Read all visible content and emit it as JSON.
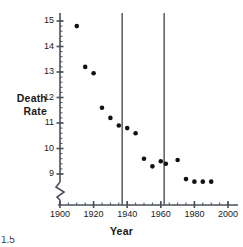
{
  "chart_data": {
    "type": "scatter",
    "title": "",
    "xlabel": "Year",
    "ylabel": "Death Rate",
    "xlim": [
      1900,
      2000
    ],
    "ylim": [
      8.45,
      15.2
    ],
    "y_axis_break": true,
    "grid": false,
    "legend": null,
    "xticks": [
      1900,
      1920,
      1940,
      1960,
      1980,
      2000
    ],
    "xtick_labels": [
      "1900",
      "1920",
      "1940",
      "1960",
      "1980",
      "2000"
    ],
    "xtick_minor_step": 5,
    "yticks": [
      9,
      10,
      11,
      12,
      13,
      14,
      15
    ],
    "ytick_labels": [
      "9",
      "10",
      "11",
      "12",
      "13",
      "14",
      "15"
    ],
    "ytick_minor_step": 0.2,
    "marker": "filled-circle",
    "marker_color": "#111111",
    "marker_size_px": 4.6,
    "x": [
      1910,
      1915,
      1920,
      1925,
      1930,
      1935,
      1940,
      1945,
      1950,
      1955,
      1960,
      1963,
      1970,
      1975,
      1980,
      1985,
      1990
    ],
    "y": [
      14.8,
      13.2,
      12.95,
      11.6,
      11.2,
      10.9,
      10.8,
      10.6,
      9.6,
      9.3,
      9.5,
      9.4,
      9.55,
      8.8,
      8.7,
      8.7,
      8.7
    ],
    "points": [
      {
        "year": 1910,
        "death_rate": 14.8
      },
      {
        "year": 1915,
        "death_rate": 13.2
      },
      {
        "year": 1920,
        "death_rate": 12.95
      },
      {
        "year": 1925,
        "death_rate": 11.6
      },
      {
        "year": 1930,
        "death_rate": 11.2
      },
      {
        "year": 1935,
        "death_rate": 10.9
      },
      {
        "year": 1940,
        "death_rate": 10.8
      },
      {
        "year": 1945,
        "death_rate": 10.6
      },
      {
        "year": 1950,
        "death_rate": 9.6
      },
      {
        "year": 1955,
        "death_rate": 9.3
      },
      {
        "year": 1960,
        "death_rate": 9.5
      },
      {
        "year": 1963,
        "death_rate": 9.4
      },
      {
        "year": 1970,
        "death_rate": 9.55
      },
      {
        "year": 1975,
        "death_rate": 8.8
      },
      {
        "year": 1980,
        "death_rate": 8.7
      },
      {
        "year": 1985,
        "death_rate": 8.7
      },
      {
        "year": 1990,
        "death_rate": 8.7
      }
    ],
    "annotations": [
      {
        "kind": "vertical-line",
        "x": 1937,
        "color": "#555a66"
      },
      {
        "kind": "vertical-line",
        "x": 1962,
        "color": "#555a66"
      }
    ],
    "colors": {
      "axis": "#4a4f59",
      "marker": "#111111",
      "reference_line": "#555a66",
      "text": "#1a1a1a",
      "background": "#ffffff"
    }
  },
  "labels": {
    "y_axis_title_line1": "Death",
    "y_axis_title_line2": "Rate",
    "x_axis_title": "Year",
    "corner_fragment": "1.5"
  }
}
